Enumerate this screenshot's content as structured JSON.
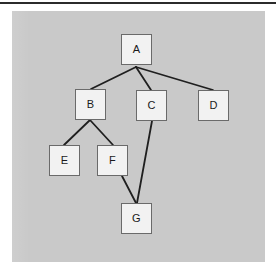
{
  "canvas": {
    "width": 276,
    "height": 277,
    "background_color": "#ffffff",
    "top_rule_color": "#2b2b2b"
  },
  "panel": {
    "name": "diagram-panel",
    "background_color": "#c9c9c9",
    "x": 12,
    "y": 11,
    "width": 253,
    "height": 251
  },
  "diagram": {
    "type": "tree-graph",
    "node_style": {
      "shape": "square",
      "fill_color": "#f2f2f2",
      "border_color": "#6a6a6a",
      "size": 31
    },
    "edge_style": {
      "color": "#1f1f1f",
      "width": 1.8
    },
    "nodes": [
      {
        "id": "A",
        "label": "A",
        "x": 121,
        "y": 34
      },
      {
        "id": "B",
        "label": "B",
        "x": 75,
        "y": 89
      },
      {
        "id": "C",
        "label": "C",
        "x": 136,
        "y": 90
      },
      {
        "id": "D",
        "label": "D",
        "x": 198,
        "y": 90
      },
      {
        "id": "E",
        "label": "E",
        "x": 49,
        "y": 145
      },
      {
        "id": "F",
        "label": "F",
        "x": 97,
        "y": 145
      },
      {
        "id": "G",
        "label": "G",
        "x": 121,
        "y": 203
      }
    ],
    "edges": [
      {
        "from": "A",
        "to": "B",
        "x1": 136,
        "y1": 67,
        "x2": 91,
        "y2": 89
      },
      {
        "from": "A",
        "to": "C",
        "x1": 136,
        "y1": 67,
        "x2": 151,
        "y2": 90
      },
      {
        "from": "A",
        "to": "D",
        "x1": 136,
        "y1": 67,
        "x2": 213,
        "y2": 90
      },
      {
        "from": "B",
        "to": "E",
        "x1": 90,
        "y1": 120,
        "x2": 64,
        "y2": 145
      },
      {
        "from": "B",
        "to": "F",
        "x1": 90,
        "y1": 120,
        "x2": 113,
        "y2": 145
      },
      {
        "from": "C",
        "to": "G",
        "x1": 152,
        "y1": 121,
        "x2": 137,
        "y2": 203
      },
      {
        "from": "F",
        "to": "G",
        "x1": 122,
        "y1": 176,
        "x2": 136,
        "y2": 203
      }
    ]
  }
}
